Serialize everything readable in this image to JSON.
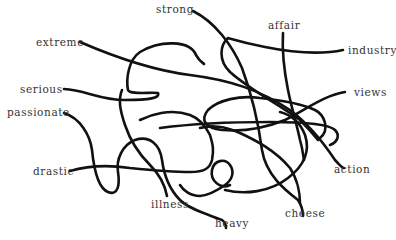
{
  "diagram": {
    "type": "tangled-lines word matching puzzle",
    "line_color": "#111111",
    "text_color": "#333333",
    "background": "#ffffff",
    "words": {
      "strong": "strong",
      "affair": "affair",
      "extreme": "extreme",
      "industry": "industry",
      "serious": "serious",
      "views": "views",
      "passionate": "passionate",
      "drastic": "drastic",
      "action": "action",
      "illness": "illness",
      "cheese": "cheese",
      "heavy": "heavy"
    }
  }
}
